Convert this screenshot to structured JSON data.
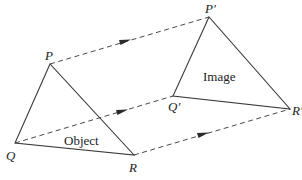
{
  "diagram": {
    "type": "translation",
    "object": {
      "label": "Object",
      "vertices": {
        "P": {
          "label": "P",
          "x": 50,
          "y": 64
        },
        "Q": {
          "label": "Q",
          "x": 15,
          "y": 143
        },
        "R": {
          "label": "R",
          "x": 134,
          "y": 155
        }
      }
    },
    "image": {
      "label": "Image",
      "vertices": {
        "P": {
          "label": "P′",
          "x": 209,
          "y": 17
        },
        "Q": {
          "label": "Q′",
          "x": 173,
          "y": 96
        },
        "R": {
          "label": "R′",
          "x": 290,
          "y": 109
        }
      }
    },
    "translation_arrows": [
      {
        "from": "P",
        "to": "P′"
      },
      {
        "from": "Q",
        "to": "Q′"
      },
      {
        "from": "R",
        "to": "R′"
      }
    ]
  }
}
